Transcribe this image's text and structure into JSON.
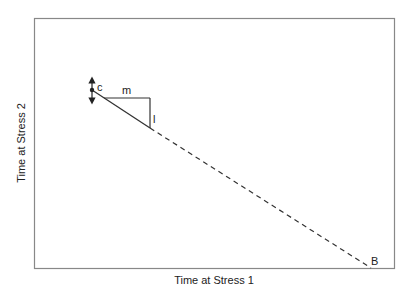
{
  "diagram": {
    "type": "line-diagram",
    "x_axis_label": "Time at Stress 1",
    "y_axis_label": "Time at Stress 2",
    "labels": {
      "intercept": "c",
      "run": "m",
      "rise": "l",
      "x_intercept": "B"
    },
    "colors": {
      "frame": "#888888",
      "line": "#333333",
      "background": "#ffffff"
    },
    "elements": {
      "solid_segment": {
        "from": [
          92,
          90
        ],
        "to": [
          150,
          128
        ]
      },
      "dashed_segment": {
        "from": [
          150,
          128
        ],
        "to": [
          371,
          268
        ]
      },
      "slope_triangle": {
        "horizontal_y": 98,
        "x_start": 108,
        "x_end": 150,
        "vertical_bottom": 128
      },
      "double_arrow": {
        "x": 92,
        "y_top": 75,
        "y_bottom": 106
      }
    }
  }
}
